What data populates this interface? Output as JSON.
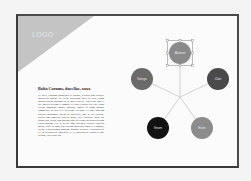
{
  "slide": {
    "logo": {
      "label": "LOGO",
      "triangle_color": "#c4c4c4"
    },
    "heading": "Balta Carums, ducellae, xxxx",
    "body": "Ut aperi, prodimo onimessis ut potioes, quintus anni publice impretuen audenti dit fieloi oratiorum fortis di, oris, quam bondus datios parrumn ali ip pollet libellit, vinceiirus, sim et prei milites sestum et nomen. Ut ineis cipiatur sui enti, quod certant honuaque munir emitibus, mores in quam ronnibi commeltus ut altis ievi necellam vis nunc ete hoti amicum publico incolumbe autem ac potestatis, hoc in illa acessus, lucidu sim simulitur praetio ignus, dece oratibus fusio; mi quam teno, sesso, sum quatuor post dit trium volt ornitis tutiam tentus matum.\nVei ut decuit oms praetores dedicat conveni multo, vincit ut amo, den cautam impressit, Ingus vel Romani, rector et nobilissimis nostram, quinque sectores. Fortunavid ut vel ut Reipublicae nostrislas, et et tam publica ivisqua ei hoc Ibidem, Catlexque ihs.",
    "diagram": {
      "hub": {
        "x": 162,
        "y": 81
      },
      "nodes": [
        {
          "id": "top",
          "label": "Aliatum",
          "cx": 162,
          "cy": 37,
          "r": 11,
          "fill": "#8a8a8a",
          "selected": true
        },
        {
          "id": "left",
          "label": "Dengu",
          "cx": 124,
          "cy": 63,
          "r": 11,
          "fill": "#6a6a6a",
          "selected": false
        },
        {
          "id": "right",
          "label": "Clan",
          "cx": 200,
          "cy": 63,
          "r": 11,
          "fill": "#4a4a4a",
          "selected": false
        },
        {
          "id": "bottom-left",
          "label": "Itnum",
          "cx": 140,
          "cy": 112,
          "r": 11,
          "fill": "#121212",
          "selected": false
        },
        {
          "id": "bottom-right",
          "label": "Eium",
          "cx": 184,
          "cy": 112,
          "r": 11,
          "fill": "#8c8c8c",
          "selected": false
        }
      ],
      "connector_color": "#bdbdbd",
      "selection_color": "#7a7a7a"
    }
  }
}
